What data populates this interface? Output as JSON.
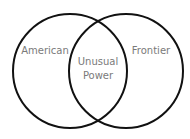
{
  "diagram": {
    "type": "venn",
    "circles": [
      {
        "id": "left",
        "label": "American",
        "cx": 70,
        "cy": 71,
        "r": 57
      },
      {
        "id": "right",
        "label": "Frontier",
        "cx": 126,
        "cy": 71,
        "r": 57
      }
    ],
    "intersection": {
      "line1": "Unusual",
      "line2": "Power"
    },
    "colors": {
      "stroke": "#111111",
      "text": "#7a7a7a",
      "background": "#ffffff"
    }
  }
}
